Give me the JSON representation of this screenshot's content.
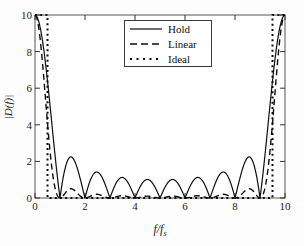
{
  "figure": {
    "background_color": "#fdfdfd",
    "axes_color": "#3a3a3a",
    "curve_color": "#101010"
  },
  "axis": {
    "xlabel": "f/f",
    "xlabel_sub": "s",
    "ylabel": "|D(f)|",
    "xticks": [
      "0",
      "2",
      "4",
      "6",
      "8",
      "10"
    ],
    "yticks": [
      "0",
      "2",
      "4",
      "6",
      "8",
      "10"
    ]
  },
  "legend": {
    "items": [
      {
        "label": "Hold",
        "style": "solid"
      },
      {
        "label": "Linear",
        "style": "dashed"
      },
      {
        "label": "Ideal",
        "style": "dotted"
      }
    ]
  },
  "chart_data": {
    "type": "line",
    "title": "",
    "xlabel": "f/f_s",
    "ylabel": "|D(f)|",
    "xlim": [
      0,
      10
    ],
    "ylim": [
      0,
      10
    ],
    "xticks": [
      0,
      2,
      4,
      6,
      8,
      10
    ],
    "yticks": [
      0,
      2,
      4,
      6,
      8,
      10
    ],
    "grid": false,
    "legend_position": "upper center",
    "interpolation_factor": 10,
    "series": [
      {
        "name": "Hold",
        "style": "solid",
        "description": "Zero-order hold frequency response, |N*sinc(f/fs)| with nulls at integer multiples of 1",
        "formula": "10*|sin(pi*x/10)/(pi*x/10)| evaluated as |sin(pi*x)/(pi*x/10)|",
        "x": [
          0,
          0.25,
          0.5,
          0.75,
          1,
          1.5,
          2,
          2.5,
          3,
          3.5,
          4,
          4.5,
          5,
          5.5,
          6,
          6.5,
          7,
          7.5,
          8,
          8.5,
          9,
          9.5,
          9.75,
          10
        ],
        "y": [
          10,
          9.36,
          7.56,
          5.0,
          0,
          2.22,
          0,
          1.35,
          0,
          0.97,
          0,
          0.76,
          0,
          0.76,
          0,
          0.97,
          0,
          1.35,
          0,
          2.22,
          0,
          5.0,
          9.36,
          10
        ],
        "sidelobe_peaks": [
          {
            "x": 1.5,
            "y": 2.22
          },
          {
            "x": 2.5,
            "y": 1.35
          },
          {
            "x": 3.5,
            "y": 0.97
          },
          {
            "x": 4.5,
            "y": 0.76
          },
          {
            "x": 5.5,
            "y": 0.76
          },
          {
            "x": 6.5,
            "y": 0.97
          },
          {
            "x": 7.5,
            "y": 1.35
          },
          {
            "x": 8.5,
            "y": 2.22
          }
        ],
        "nulls": [
          1,
          2,
          3,
          4,
          5,
          6,
          7,
          8,
          9
        ]
      },
      {
        "name": "Linear",
        "style": "dashed",
        "description": "Linear interpolation (first-order hold) response, sinc-squared shape decaying rapidly",
        "x": [
          0,
          0.25,
          0.5,
          0.75,
          1,
          1.5,
          2,
          2.5,
          3,
          3.5,
          4,
          4.5,
          5,
          5.5,
          6,
          6.5,
          7,
          7.5,
          8,
          8.5,
          9,
          9.5,
          9.75,
          10
        ],
        "y": [
          10,
          8.76,
          5.71,
          2.5,
          0,
          0.49,
          0,
          0.18,
          0,
          0.09,
          0,
          0.06,
          0,
          0.06,
          0,
          0.09,
          0,
          0.18,
          0,
          0.49,
          0,
          2.5,
          8.76,
          10
        ],
        "sidelobe_peaks": [
          {
            "x": 1.5,
            "y": 0.49
          },
          {
            "x": 2.5,
            "y": 0.18
          },
          {
            "x": 3.5,
            "y": 0.09
          },
          {
            "x": 4.5,
            "y": 0.06
          },
          {
            "x": 5.5,
            "y": 0.06
          },
          {
            "x": 6.5,
            "y": 0.09
          },
          {
            "x": 7.5,
            "y": 0.18
          },
          {
            "x": 8.5,
            "y": 0.49
          }
        ],
        "nulls": [
          1,
          2,
          3,
          4,
          5,
          6,
          7,
          8,
          9
        ]
      },
      {
        "name": "Ideal",
        "style": "dotted",
        "description": "Ideal brick-wall lowpass response: constant 10 for |f/fs| < 0.5, zero elsewhere, repeating near 9.5-10",
        "x": [
          0,
          0.5,
          0.5,
          9.5,
          9.5,
          10
        ],
        "y": [
          10,
          10,
          0,
          0,
          10,
          10
        ],
        "cutoff": 0.5,
        "passband_level": 10
      }
    ]
  }
}
